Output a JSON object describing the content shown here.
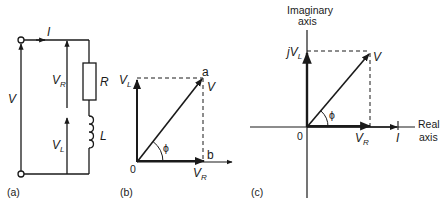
{
  "figure": {
    "panel_a": {
      "caption": "(a)",
      "current_label": "I",
      "source_voltage_label": "V",
      "vr_label": "V",
      "vr_sub": "R",
      "vl_label": "V",
      "vl_sub": "L",
      "resistor_label": "R",
      "inductor_label": "L"
    },
    "panel_b": {
      "caption": "(b)",
      "vl_label": "V",
      "vl_sub": "L",
      "v_label": "V",
      "point_a": "a",
      "point_b": "b",
      "origin": "0",
      "phi": "ϕ",
      "vr_label": "V",
      "vr_sub": "R"
    },
    "panel_c": {
      "caption": "(c)",
      "imag_axis_line1": "Imaginary",
      "imag_axis_line2": "axis",
      "real_axis_line1": "Real",
      "real_axis_line2": "axis",
      "jvl_prefix": "j",
      "jvl_label": "V",
      "jvl_sub": "L",
      "v_label": "V",
      "origin": "0",
      "phi": "ϕ",
      "vr_label": "V",
      "vr_sub": "R",
      "i_label": "I"
    },
    "colors": {
      "ink": "#1a1a1a",
      "background": "#ffffff"
    }
  }
}
